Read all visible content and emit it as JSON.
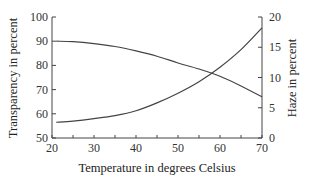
{
  "chart_data": {
    "type": "line",
    "title": "",
    "xlabel": "Temperature in degrees Celsius",
    "ylabel": "Transparency in percent",
    "ylabel_right": "Haze in percent",
    "xlim": [
      20,
      70
    ],
    "ylim": [
      50,
      100
    ],
    "ylim_right": [
      0,
      20
    ],
    "x_ticks": [
      "20",
      "30",
      "40",
      "50",
      "60",
      "70"
    ],
    "y_ticks": [
      "50",
      "60",
      "70",
      "80",
      "90",
      "100"
    ],
    "y_ticks_right": [
      "0",
      "5",
      "10",
      "15",
      "20"
    ],
    "grid": false,
    "legend": null,
    "x": [
      21,
      25,
      30,
      35,
      40,
      45,
      50,
      55,
      60,
      65,
      70
    ],
    "series": [
      {
        "name": "Transparency",
        "axis": "left",
        "values": [
          90,
          89.8,
          89,
          87.8,
          86,
          83.8,
          81,
          78.5,
          75.5,
          71.5,
          67
        ]
      },
      {
        "name": "Haze",
        "axis": "right",
        "values": [
          2.6,
          2.8,
          3.2,
          3.7,
          4.5,
          5.8,
          7.4,
          9.3,
          11.7,
          14.6,
          18.2
        ]
      }
    ]
  }
}
